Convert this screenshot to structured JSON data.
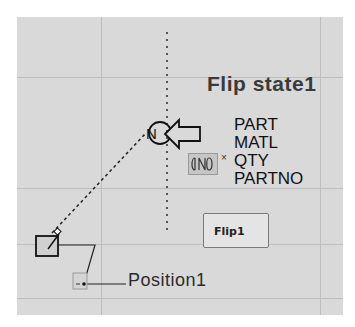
{
  "drawing": {
    "background_color": "#d9d9d9",
    "gridline_color": "#bdbdbd",
    "flip_state_label": "Flip state1",
    "attributes": [
      "PART",
      "MATL",
      "QTY",
      "PARTNO"
    ],
    "flip_parameter_button": "Flip1",
    "position_parameter_label": "Position1",
    "flip_grip_icon": "flip-arrows-icon",
    "flip_grip_marker": "×",
    "flip_arrow_icon": "flip-arrow-icon",
    "base_point_icon": "base-point-square-icon",
    "position_grip_icon": "position-grip-icon"
  }
}
